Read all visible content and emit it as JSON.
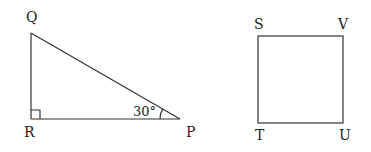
{
  "diagram": {
    "triangle": {
      "name": "PQR",
      "vertices": {
        "Q": {
          "label": "Q",
          "x": 31,
          "y": 33,
          "label_x": 26,
          "label_y": 22
        },
        "R": {
          "label": "R",
          "x": 31,
          "y": 119,
          "label_x": 24,
          "label_y": 137
        },
        "P": {
          "label": "P",
          "x": 180,
          "y": 119,
          "label_x": 186,
          "label_y": 137
        }
      },
      "right_angle_at": "R",
      "angle": {
        "vertex": "P",
        "value": "30°"
      }
    },
    "square": {
      "name": "STUV",
      "vertices": {
        "S": {
          "label": "S",
          "x": 258,
          "y": 36,
          "label_x": 254,
          "label_y": 29
        },
        "V": {
          "label": "V",
          "x": 343,
          "y": 36,
          "label_x": 338,
          "label_y": 29
        },
        "T": {
          "label": "T",
          "x": 258,
          "y": 123,
          "label_x": 255,
          "label_y": 140
        },
        "U": {
          "label": "U",
          "x": 343,
          "y": 123,
          "label_x": 339,
          "label_y": 140
        }
      }
    },
    "colors": {
      "stroke": "#333333",
      "text": "#222222",
      "background": "#ffffff"
    }
  }
}
